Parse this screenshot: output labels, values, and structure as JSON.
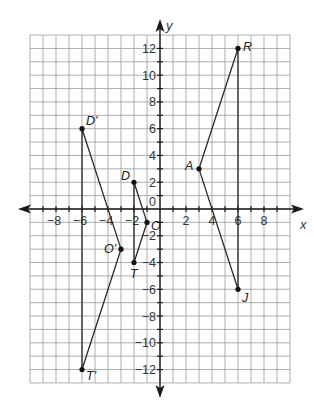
{
  "chart_data": {
    "type": "scatter",
    "title": "",
    "xlabel": "x",
    "ylabel": "y",
    "xlim": [
      -10,
      10
    ],
    "ylim": [
      -13,
      13
    ],
    "grid": true,
    "x_ticks": [
      -8,
      -6,
      -4,
      -2,
      2,
      4,
      6,
      8
    ],
    "y_ticks": [
      -12,
      -10,
      -8,
      -6,
      -4,
      -2,
      2,
      4,
      6,
      8,
      10,
      12
    ],
    "origin_label": "0",
    "points": [
      {
        "label": "R",
        "x": 6,
        "y": 12
      },
      {
        "label": "A",
        "x": 3,
        "y": 3
      },
      {
        "label": "J",
        "x": 6,
        "y": -6
      },
      {
        "label": "D",
        "x": -2,
        "y": 2
      },
      {
        "label": "O",
        "x": -1,
        "y": -1
      },
      {
        "label": "T",
        "x": -2,
        "y": -4
      },
      {
        "label": "D'",
        "x": -6,
        "y": 6
      },
      {
        "label": "O'",
        "x": -3,
        "y": -3
      },
      {
        "label": "T'",
        "x": -6,
        "y": -12
      }
    ],
    "series": [
      {
        "name": "Triangle RAJ",
        "vertices": [
          "R",
          "A",
          "J"
        ]
      },
      {
        "name": "Triangle DOT",
        "vertices": [
          "D",
          "O",
          "T"
        ]
      },
      {
        "name": "Triangle D'O'T'",
        "vertices": [
          "D'",
          "O'",
          "T'"
        ]
      }
    ]
  }
}
